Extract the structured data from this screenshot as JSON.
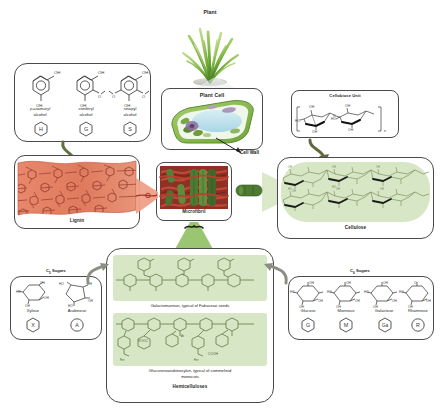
{
  "figure": {
    "type": "diagram"
  },
  "center_column": {
    "plant_label": "Plant",
    "plant_cell_label": "Plant Cell",
    "cell_wall_label": "Cell Wall",
    "microfibril_label": "Microfibril"
  },
  "monolignols": {
    "items": [
      {
        "name_line1": "p-coumaryl",
        "name_line2": "alcohol",
        "code": "H",
        "code_shape": "hexagon"
      },
      {
        "name_line1": "coniferyl",
        "name_line2": "alcohol",
        "code": "G",
        "code_shape": "hexagon"
      },
      {
        "name_line1": "sinapyl",
        "name_line2": "alcohol",
        "code": "S",
        "code_shape": "hexagon"
      }
    ],
    "labels": {
      "oh": "OH",
      "o": "O"
    }
  },
  "lignin": {
    "label": "Lignin",
    "sheet_color": "#e8876b",
    "sheet_color_dark": "#d9694c"
  },
  "cellobiose": {
    "label": "Cellobiose Unit",
    "atom_labels": [
      "OH",
      "OH",
      "HO",
      "HO",
      "OH",
      "OH",
      "O",
      "O",
      "n"
    ]
  },
  "cellulose": {
    "label": "Cellulose",
    "panel_color": "#d7e6c4"
  },
  "hemicelluloses": {
    "label": "Hemicelluloses",
    "panels": [
      {
        "caption_line1": "Galactomannan, typical of Fabaceae seeds",
        "caption_line2": ""
      },
      {
        "caption_line1": "Glucuronoarabinoxylan, typical of commelinid",
        "caption_line2": "monocots"
      }
    ],
    "panel_color": "#d7e6c4",
    "chem_labels": [
      "ROOC",
      "COOH",
      "Fer",
      "Ar"
    ]
  },
  "c5_sugars": {
    "title": "C5 Sugars",
    "title_sub": "5",
    "title_prefix": "C",
    "title_suffix": " Sugars",
    "items": [
      {
        "name": "Xylose",
        "code": "X",
        "code_shape": "hexagon"
      },
      {
        "name": "Arabinose",
        "code": "A",
        "code_shape": "circle"
      }
    ]
  },
  "c6_sugars": {
    "title_prefix": "C",
    "title_sub": "6",
    "title_suffix": " Sugars",
    "items": [
      {
        "name": "Glucose",
        "code": "G",
        "code_shape": "hexagon"
      },
      {
        "name": "Mannose",
        "code": "M",
        "code_shape": "hexagon"
      },
      {
        "name": "Galactose",
        "code": "Ga",
        "code_shape": "hexagon"
      },
      {
        "name": "Rhamnose",
        "code": "R",
        "code_shape": "circle"
      }
    ]
  },
  "colors": {
    "lignin": "#e8876b",
    "cellulose_green": "#cfe3b6",
    "arrow_green": "#6e7f4e",
    "arrow_grey": "#8a8f82",
    "outline": "#4a4a4a",
    "microfibril_red": "#9b3226",
    "microfibril_green": "#4e7a34"
  }
}
